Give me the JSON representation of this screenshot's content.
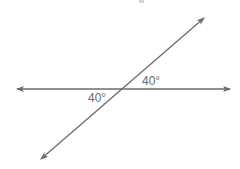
{
  "diagram": {
    "type": "intersecting-lines",
    "line_color": "#6b6b6b",
    "label_color": "#6b6b6b",
    "horizontal_line": {
      "x1": 17,
      "y1": 89,
      "x2": 230,
      "y2": 89,
      "arrows": "both"
    },
    "transversal_line": {
      "x1": 41,
      "y1": 159,
      "x2": 204,
      "y2": 18,
      "arrows": "both"
    },
    "intersection": {
      "x": 122,
      "y": 89
    },
    "angles": [
      {
        "position": "upper-right",
        "label": "40°"
      },
      {
        "position": "lower-left",
        "label": "40°"
      }
    ]
  }
}
